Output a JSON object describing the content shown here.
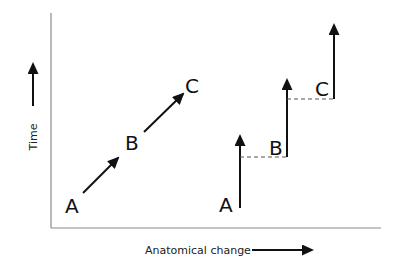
{
  "diagram": {
    "axes": {
      "y_label": "Time",
      "x_label": "Anatomical change",
      "axis_color": "#8a8a8a",
      "arrow_color": "#111111"
    },
    "left_panel": {
      "model": "gradual",
      "points": [
        {
          "label": "A"
        },
        {
          "label": "B"
        },
        {
          "label": "C"
        }
      ]
    },
    "right_panel": {
      "model": "punctuated",
      "points": [
        {
          "label": "A"
        },
        {
          "label": "B"
        },
        {
          "label": "C"
        }
      ]
    }
  }
}
